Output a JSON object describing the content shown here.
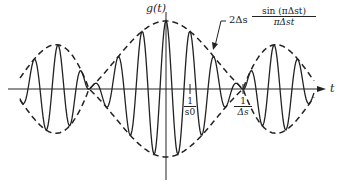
{
  "figure": {
    "y_axis_label": "g(t)",
    "x_axis_label": "t",
    "envelope_label": {
      "prefix": "2Δs",
      "numerator": "sin (πΔst)",
      "denominator": "πΔst"
    },
    "tick_carrier": {
      "numerator": "1",
      "denominator": "s0"
    },
    "tick_bandwidth": {
      "numerator": "1",
      "denominator": "Δs"
    }
  },
  "geometry": {
    "center_x": 166,
    "axis_y": 89,
    "amplitude_px": 68,
    "first_zero_px": 77,
    "carrier_period_px": 24
  },
  "colors": {
    "ink": "#222222",
    "background": "#ffffff"
  }
}
